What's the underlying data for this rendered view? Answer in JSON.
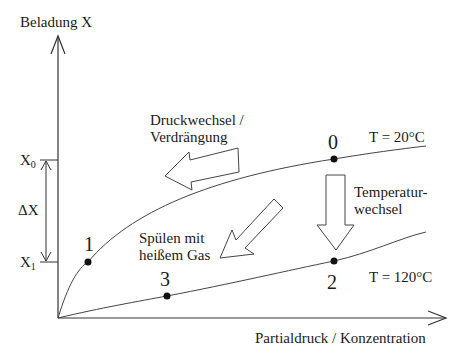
{
  "diagram": {
    "y_axis_label": "Beladung X",
    "x_axis_label": "Partialdruck / Konzentration",
    "x0_label": "X",
    "x0_sub": "0",
    "x1_label": "X",
    "x1_sub": "1",
    "delta_label": "ΔX",
    "isotherms": [
      {
        "label": "T = 20°C"
      },
      {
        "label": "T = 120°C"
      }
    ],
    "points": [
      {
        "label": "0"
      },
      {
        "label": "1"
      },
      {
        "label": "2"
      },
      {
        "label": "3"
      }
    ],
    "arrows": {
      "pressure_swing_line1": "Druckwechsel /",
      "pressure_swing_line2": "Verdrängung",
      "temperature_swing_line1": "Temperatur-",
      "temperature_swing_line2": "wechsel",
      "purge_line1": "Spülen mit",
      "purge_line2": "heißem Gas"
    }
  }
}
